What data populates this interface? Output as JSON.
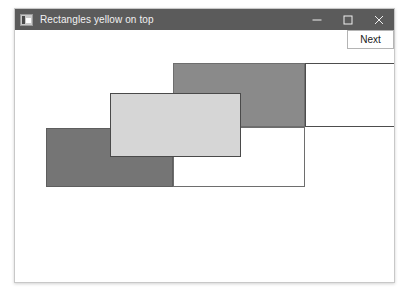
{
  "window": {
    "title": "Rectangles yellow on top",
    "icon": "application-icon",
    "controls": {
      "minimize": "minimize-icon",
      "maximize": "maximize-icon",
      "close": "close-icon"
    }
  },
  "toolbar": {
    "next_label": "Next"
  },
  "canvas": {
    "background": "#ffffff",
    "rectangles": [
      {
        "name": "rect-white-right",
        "x": 290,
        "y": 33,
        "width": 90,
        "height": 64,
        "fill": "#ffffff",
        "stroke": "#4d4d4d"
      },
      {
        "name": "rect-white-bottom",
        "x": 158,
        "y": 97,
        "width": 132,
        "height": 60,
        "fill": "#ffffff",
        "stroke": "#6e6e6e"
      },
      {
        "name": "rect-gray-top",
        "x": 158,
        "y": 33,
        "width": 132,
        "height": 64,
        "fill": "#8a8a8a",
        "stroke": "#6e6e6e"
      },
      {
        "name": "rect-gray-bottom-left",
        "x": 31,
        "y": 98,
        "width": 127,
        "height": 59,
        "fill": "#757575",
        "stroke": "#5e5e5e"
      },
      {
        "name": "rect-light-center",
        "x": 95,
        "y": 63,
        "width": 131,
        "height": 64,
        "fill": "#d6d6d6",
        "stroke": "#4a4a4a"
      }
    ]
  }
}
